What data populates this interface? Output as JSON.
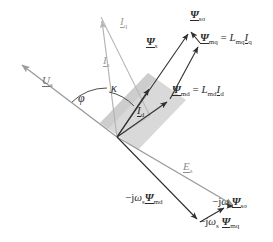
{
  "figure": {
    "kind": "phasor-diagram",
    "title_visible": false,
    "background": "#ffffff",
    "size": {
      "width": 273,
      "height": 242
    }
  },
  "colors": {
    "dark_vector": "#2f2f2f",
    "gray_vector": "#9a9a9a",
    "light_vector": "#b5b5b5",
    "shaded_band": "#cfcfcf",
    "label_dark": "#2b2b2b",
    "label_gray": "#8c8c8c"
  },
  "origin": {
    "x": 117,
    "y": 137
  },
  "vectors": [
    {
      "id": "Us",
      "label": "U_s",
      "label_html": "<span class=\"it ul\">U</span><sub>s</sub>",
      "style": "gray",
      "from": {
        "x": 117,
        "y": 137
      },
      "to": {
        "x": 18,
        "y": 62
      },
      "arrow": true,
      "label_pos": {
        "x": 44,
        "y": 82
      }
    },
    {
      "id": "Es",
      "label": "E_s",
      "label_html": "<span class=\"it ul\">E</span><sub>s</sub>",
      "style": "gray",
      "from": {
        "x": 117,
        "y": 137
      },
      "to": {
        "x": 236,
        "y": 207
      },
      "arrow": true,
      "label_pos": {
        "x": 184,
        "y": 167
      }
    },
    {
      "id": "Is",
      "label": "I_s",
      "label_html": "<span class=\"it ul\">I</span><sub>s</sub>",
      "style": "light",
      "from": {
        "x": 117,
        "y": 137
      },
      "to": {
        "x": 101,
        "y": 17
      },
      "arrow": true,
      "label_pos": {
        "x": 106,
        "y": 62
      }
    },
    {
      "id": "Iq",
      "label": "I_q",
      "label_html": "<span class=\"it ul\">I</span><sub>q</sub>",
      "style": "light",
      "from": {
        "x": 101,
        "y": 17
      },
      "to": {
        "x": 150,
        "y": 116
      },
      "arrow": false,
      "label_pos": {
        "x": 122,
        "y": 22
      }
    },
    {
      "id": "Id",
      "label": "I_d",
      "label_html": "<span class=\"it ul\">I</span><sub>d</sub>",
      "style": "dark",
      "from": {
        "x": 117,
        "y": 137
      },
      "to": {
        "x": 151,
        "y": 85
      },
      "arrow": true,
      "label_pos": {
        "x": 138,
        "y": 110
      }
    },
    {
      "id": "Psi_s",
      "label": "Psi_s",
      "label_html": "<span class=\"psi ul\">&Psi;</span><sub>s</sub>",
      "style": "dark",
      "from": {
        "x": 117,
        "y": 137
      },
      "to": {
        "x": 190,
        "y": 30
      },
      "arrow": true,
      "label_pos": {
        "x": 150,
        "y": 45
      }
    },
    {
      "id": "Psi_md",
      "label": "Psi_md",
      "label_html": "<span class=\"psi ul\">&Psi;</span><sub>md</sub> = <span class=\"it\">L</span><sub>md</sub><span class=\"it ul\">I</span><sub>d</sub>",
      "style": "dark",
      "from": {
        "x": 117,
        "y": 137
      },
      "to": {
        "x": 170,
        "y": 99
      },
      "arrow": true,
      "label_pos": {
        "x": 173,
        "y": 87
      }
    },
    {
      "id": "Psi_mq",
      "label": "Psi_mq",
      "label_html": "<span class=\"psi ul\">&Psi;</span><sub>mq</sub> = <span class=\"it\">L</span><sub>mq</sub><span class=\"it ul\">I</span><sub>q</sub>",
      "style": "dark",
      "from": {
        "x": 170,
        "y": 99
      },
      "to": {
        "x": 200,
        "y": 43
      },
      "arrow": true,
      "label_pos": {
        "x": 202,
        "y": 36
      }
    },
    {
      "id": "Psi_ssigma",
      "label": "Psi_ssigma",
      "label_html": "<span class=\"psi ul\">&Psi;</span><sub>s&sigma;</sub>",
      "style": "dark",
      "from": {
        "x": 200,
        "y": 43
      },
      "to": {
        "x": 190,
        "y": 30
      },
      "arrow": true,
      "label_pos": {
        "x": 191,
        "y": 15
      }
    },
    {
      "id": "mjw_Psi_md",
      "label": "-j omega_s Psi_md",
      "label_html": "&minus;j<span class=\"it\">&omega;</span><sub>s</sub><span class=\"psi ul\">&Psi;</span><sub>md</sub>",
      "style": "dark",
      "from": {
        "x": 117,
        "y": 137
      },
      "to": {
        "x": 200,
        "y": 222
      },
      "arrow": true,
      "label_pos": {
        "x": 126,
        "y": 196
      }
    },
    {
      "id": "mjw_Psi_mq",
      "label": "-j omega_s Psi_mq",
      "label_html": "&minus;j<span class=\"it\">&omega;</span><sub>s</sub> <span class=\"psi ul\">&Psi;</span><sub>mq</sub>",
      "style": "dark",
      "from": {
        "x": 200,
        "y": 222
      },
      "to": {
        "x": 227,
        "y": 206
      },
      "arrow": true,
      "label_pos": {
        "x": 199,
        "y": 218
      }
    },
    {
      "id": "mjw_Psi_ssigma",
      "label": "-j omega_s Psi_ssigma",
      "label_html": "&minus;j<span class=\"it\">&omega;</span><sub>s</sub><span class=\"psi ul\">&Psi;</span><sub>s&sigma;</sub>",
      "style": "dark",
      "from": {
        "x": 227,
        "y": 206
      },
      "to": {
        "x": 236,
        "y": 207
      },
      "arrow": true,
      "label_pos": {
        "x": 215,
        "y": 199
      }
    }
  ],
  "angles": [
    {
      "id": "phi",
      "label_html": "<span class=\"ang\">&phi;</span>",
      "label_pos": {
        "x": 80,
        "y": 98
      },
      "between": [
        "Us",
        "Is"
      ]
    },
    {
      "id": "kappa",
      "label_html": "<span class=\"ang\">&kappa;</span>",
      "label_pos": {
        "x": 113,
        "y": 88
      },
      "between": [
        "Is",
        "Psi_s"
      ]
    }
  ],
  "labels": {
    "Us": "U_s",
    "Es": "E_s",
    "Is": "I_s",
    "Iq": "I_q",
    "Id": "I_d",
    "Psi_s": "Ψ_s",
    "Psi_ssigma": "Ψ_sσ",
    "Psi_md_eq": "Ψ_md = L_md I_d",
    "Psi_mq_eq": "Ψ_mq = L_mq I_q",
    "mjw_Psi_md": "−jω_s Ψ_md",
    "mjw_Psi_mq": "−jω_s Ψ_mq",
    "mjw_Psi_ssigma": "−jω_s Ψ_sσ",
    "phi": "φ",
    "kappa": "κ"
  }
}
